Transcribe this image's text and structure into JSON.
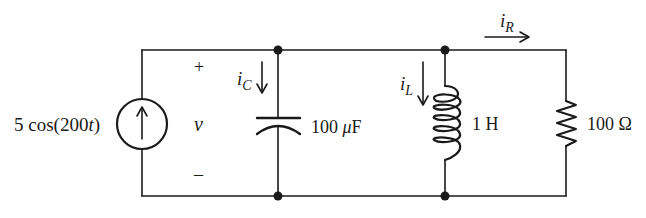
{
  "diagram": {
    "type": "circuit-schematic",
    "colors": {
      "wire": "#1a1a1a",
      "background": "#ffffff"
    },
    "source": {
      "kind": "current-source",
      "label": "5 cos(200t)",
      "label_prefix": "5 cos(200",
      "label_var": "t",
      "label_suffix": ")",
      "direction": "up"
    },
    "voltage": {
      "symbol": "v",
      "plus": "+",
      "minus": "–"
    },
    "capacitor": {
      "value": "100 μF",
      "value_num": "100 ",
      "value_unit_mu": "μ",
      "value_unit": "F",
      "current": {
        "symbol": "i",
        "subscript": "C",
        "direction": "down"
      }
    },
    "inductor": {
      "value": "1 H",
      "current": {
        "symbol": "i",
        "subscript": "L",
        "direction": "down"
      }
    },
    "resistor": {
      "value": "100 Ω",
      "current": {
        "symbol": "i",
        "subscript": "R",
        "direction": "right"
      }
    }
  }
}
